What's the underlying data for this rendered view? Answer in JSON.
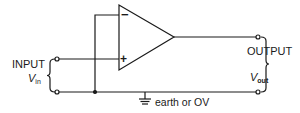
{
  "diagram": {
    "input_label": "INPUT",
    "input_voltage": "V",
    "input_voltage_sub": "in",
    "output_label": "OUTPUT",
    "output_voltage": "V",
    "output_voltage_sub": "out",
    "ground_label": "earth or OV",
    "minus_sign": "−",
    "plus_sign": "+",
    "stroke_color": "#1a1a1a",
    "background": "#ffffff"
  }
}
